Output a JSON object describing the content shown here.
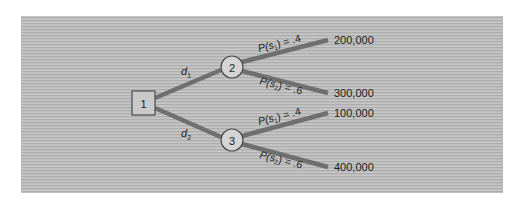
{
  "diagram": {
    "type": "decision-tree",
    "background_color": "#b9b9b9",
    "branch_color": "#6f6f6f",
    "decision_node": {
      "id": "1",
      "shape": "square",
      "label": "1"
    },
    "decisions": [
      {
        "label": "d",
        "subscript": "1",
        "chance_node": {
          "id": "2",
          "shape": "circle",
          "label": "2"
        },
        "outcomes": [
          {
            "prob_prefix": "P(s",
            "prob_sub": "1",
            "prob_suffix": ") = .4",
            "payoff": "200,000"
          },
          {
            "prob_prefix": "P(s",
            "prob_sub": "2",
            "prob_suffix": ") = .6",
            "payoff": "300,000"
          }
        ]
      },
      {
        "label": "d",
        "subscript": "2",
        "chance_node": {
          "id": "3",
          "shape": "circle",
          "label": "3"
        },
        "outcomes": [
          {
            "prob_prefix": "P(s",
            "prob_sub": "1",
            "prob_suffix": ") = .4",
            "payoff": "100,000"
          },
          {
            "prob_prefix": "P(s",
            "prob_sub": "2",
            "prob_suffix": ") = .6",
            "payoff": "400,000"
          }
        ]
      }
    ]
  }
}
